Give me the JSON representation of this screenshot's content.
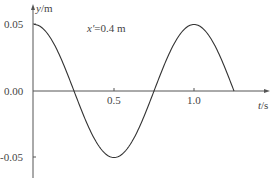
{
  "chart_data": {
    "type": "line",
    "title": "",
    "annotation": "x′=0.4 m",
    "xlabel": "t/s",
    "ylabel": "y/m",
    "x_ticks": [
      "0.5",
      "1.0"
    ],
    "y_ticks": [
      "0.05",
      "0.00",
      "-0.05"
    ],
    "xlim": [
      0,
      1.3
    ],
    "ylim": [
      -0.06,
      0.06
    ],
    "grid": false,
    "series": [
      {
        "name": "y(t)",
        "x": [
          0,
          0.25,
          0.5,
          0.75,
          1.0,
          1.25
        ],
        "y": [
          0.05,
          0.0,
          -0.05,
          0.0,
          0.05,
          0.0
        ]
      }
    ]
  },
  "labels": {
    "ylabel_var": "y",
    "ylabel_unit": "/m",
    "xlabel_var": "t",
    "xlabel_unit": "/s",
    "annotation_var": "x′",
    "annotation_val": "=0.4 m",
    "ytick_top": "0.05",
    "ytick_zero": "0.00",
    "ytick_bottom": "-0.05",
    "xtick_1": "0.5",
    "xtick_2": "1.0"
  }
}
